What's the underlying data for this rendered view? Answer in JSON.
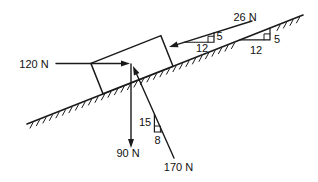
{
  "figure": {
    "background": "#ffffff",
    "ink": "#1a1a1a"
  },
  "forces": {
    "f120": {
      "label": "120 N"
    },
    "f26": {
      "label": "26 N"
    },
    "f90": {
      "label": "90 N"
    },
    "f170": {
      "label": "170 N"
    }
  },
  "triangles": {
    "on_arrow_26n": {
      "run": "12",
      "rise": "5"
    },
    "on_incline": {
      "run": "12",
      "rise": "5"
    },
    "on_force_170n": {
      "rise": "15",
      "run": "8"
    }
  }
}
